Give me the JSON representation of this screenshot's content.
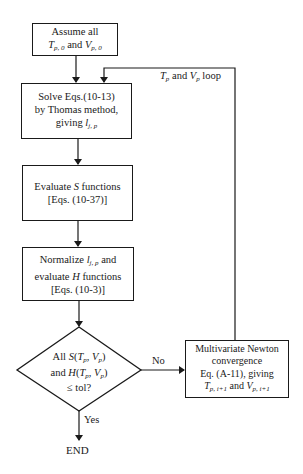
{
  "diagram": {
    "type": "flowchart",
    "nodes": {
      "assume": {
        "shape": "rectangle",
        "lines": [
          "Assume all",
          "T_p,0 and V_p,0"
        ],
        "line1": "Assume all",
        "t_var": "T",
        "t_sub": "p, 0",
        "and": " and ",
        "v_var": "V",
        "v_sub": "p, 0"
      },
      "solve": {
        "shape": "rectangle",
        "lines": [
          "Solve Eqs.(10-13)",
          "by Thomas method,",
          "giving l_j,p"
        ],
        "line1": "Solve Eqs.(10-13)",
        "line2": "by Thomas method,",
        "line3_prefix": "giving ",
        "l_var": "l",
        "l_sub": "j, p"
      },
      "evaluate_s": {
        "shape": "rectangle",
        "lines": [
          "Evaluate S functions",
          "[Eqs. (10-37)]"
        ],
        "line1_prefix": "Evaluate ",
        "s_var": "S",
        "line1_suffix": " functions",
        "line2": "[Eqs. (10-37)]"
      },
      "normalize": {
        "shape": "rectangle",
        "lines": [
          "Normalize l_j,p and",
          "evaluate H functions",
          "[Eqs. (10-3)]"
        ],
        "line1_prefix": "Normalize ",
        "l_var": "l",
        "l_sub": "j, p",
        "line1_suffix": " and",
        "line2_prefix": "evaluate ",
        "h_var": "H",
        "line2_suffix": " functions",
        "line3": "[Eqs. (10-3)]"
      },
      "decision": {
        "shape": "diamond",
        "lines": [
          "All S(T_p, V_p)",
          "and H(T_p, V_p)",
          "≤ tol?"
        ],
        "l1_prefix": "All ",
        "l2_prefix": "and ",
        "s_fn": "S",
        "h_fn": "H",
        "t": "T",
        "v": "V",
        "p": "p",
        "open": "(",
        "comma": ", ",
        "close": ")",
        "line3": "≤ tol?"
      },
      "newton": {
        "shape": "rectangle",
        "lines": [
          "Multivariate Newton",
          "convergence",
          "Eq. (A-11), giving",
          "T_p,i+1 and V_p,i+1"
        ],
        "line1": "Multivariate Newton",
        "line2": "convergence",
        "line3": "Eq. (A-11), giving",
        "t_var": "T",
        "t_sub": "p, i+1",
        "and": " and ",
        "v_var": "V",
        "v_sub": "p, i+1"
      },
      "end": {
        "shape": "terminal-text",
        "label": "END"
      }
    },
    "edges": [
      {
        "from": "assume",
        "to": "solve",
        "label": ""
      },
      {
        "from": "solve",
        "to": "evaluate_s",
        "label": ""
      },
      {
        "from": "evaluate_s",
        "to": "normalize",
        "label": ""
      },
      {
        "from": "normalize",
        "to": "decision",
        "label": ""
      },
      {
        "from": "decision",
        "to": "newton",
        "label": "No"
      },
      {
        "from": "decision",
        "to": "end",
        "label": "Yes"
      },
      {
        "from": "newton",
        "to": "solve",
        "label": "T_p and V_p loop"
      }
    ],
    "edge_labels": {
      "no": "No",
      "yes": "Yes",
      "loop_t": "T",
      "loop_sub": "p",
      "loop_and": " and ",
      "loop_v": "V",
      "loop_suffix": " loop"
    },
    "colors": {
      "stroke": "#1a1a1a",
      "background": "#ffffff"
    }
  }
}
